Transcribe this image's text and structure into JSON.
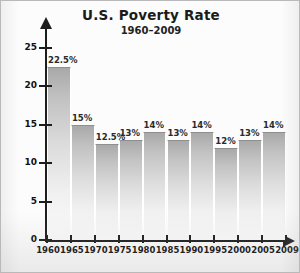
{
  "chart_data": {
    "type": "bar",
    "title": "U.S. Poverty Rate",
    "subtitle": "1960–2009",
    "xlabel": "",
    "ylabel": "Percent of Population",
    "ylim": [
      0,
      25
    ],
    "yticks": [
      0,
      5,
      10,
      15,
      20,
      25
    ],
    "ytick_labels": [
      "0",
      "5",
      "10",
      "15",
      "20",
      "25"
    ],
    "grid": false,
    "legend": null,
    "x_tick_labels": [
      "1960",
      "1965",
      "1970",
      "1975",
      "1980",
      "1985",
      "1990",
      "1995",
      "2000",
      "2005",
      "2009"
    ],
    "categories": [
      "1960–1965",
      "1965–1970",
      "1970–1975",
      "1975–1980",
      "1980–1985",
      "1985–1990",
      "1990–1995",
      "1995–2000",
      "2000–2005",
      "2005–2009"
    ],
    "values": [
      22.5,
      15,
      12.5,
      13,
      14,
      13,
      14,
      12,
      13,
      14
    ],
    "data_labels": [
      "22.5%",
      "15%",
      "12.5%",
      "13%",
      "14%",
      "13%",
      "14%",
      "12%",
      "13%",
      "14%"
    ],
    "bar_color": "#c8c8c8",
    "axis_color": "#1d1d1d",
    "text_color": "#111111",
    "background_color": "#fcfcfc"
  }
}
